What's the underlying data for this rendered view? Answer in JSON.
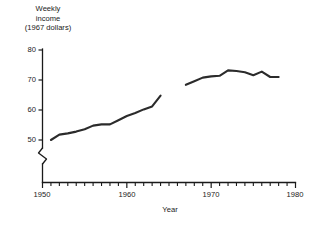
{
  "chart_data": {
    "type": "line",
    "title": "",
    "ylabel": "Weekly income (1967 dollars)",
    "ylabel_lines": [
      "Weekly",
      "income",
      "(1967 dollars)"
    ],
    "xlabel": "Year",
    "xlim": [
      1950,
      1980
    ],
    "ylim": [
      50,
      80
    ],
    "y_axis_break": true,
    "y_axis_break_note": "zigzag break below 50",
    "grid": false,
    "legend": null,
    "y_ticks": [
      50,
      60,
      70,
      80
    ],
    "y_tick_labels": [
      "50",
      "60",
      "70",
      "80"
    ],
    "x_ticks": [
      1950,
      1960,
      1970,
      1980
    ],
    "x_tick_labels": [
      "1950",
      "1960",
      "1970",
      "1980"
    ],
    "x_minor_tick_interval": 1,
    "line_color": "#2b2b2b",
    "series": [
      {
        "name": "segment-1",
        "x": [
          1951,
          1952,
          1953,
          1954,
          1955,
          1956,
          1957,
          1958,
          1959,
          1960,
          1961,
          1962,
          1963,
          1964
        ],
        "values": [
          50.0,
          51.8,
          52.2,
          52.8,
          53.6,
          54.8,
          55.2,
          55.2,
          56.6,
          58.0,
          59.0,
          60.2,
          61.2,
          64.8
        ]
      },
      {
        "name": "segment-2",
        "x": [
          1967,
          1968,
          1969,
          1970,
          1971,
          1972,
          1973,
          1974,
          1975,
          1976,
          1977,
          1978
        ],
        "values": [
          68.4,
          69.6,
          70.8,
          71.2,
          71.4,
          73.2,
          73.0,
          72.6,
          71.6,
          72.8,
          71.0,
          71.0
        ]
      }
    ]
  },
  "axis_titles": {
    "y": "Weekly income (1967 dollars)",
    "y_line1": "Weekly",
    "y_line2": "income",
    "y_line3": "(1967 dollars)",
    "x": "Year"
  },
  "ticks": {
    "y": [
      "80",
      "70",
      "60",
      "50"
    ],
    "x": [
      "1950",
      "1960",
      "1970",
      "1980"
    ]
  }
}
